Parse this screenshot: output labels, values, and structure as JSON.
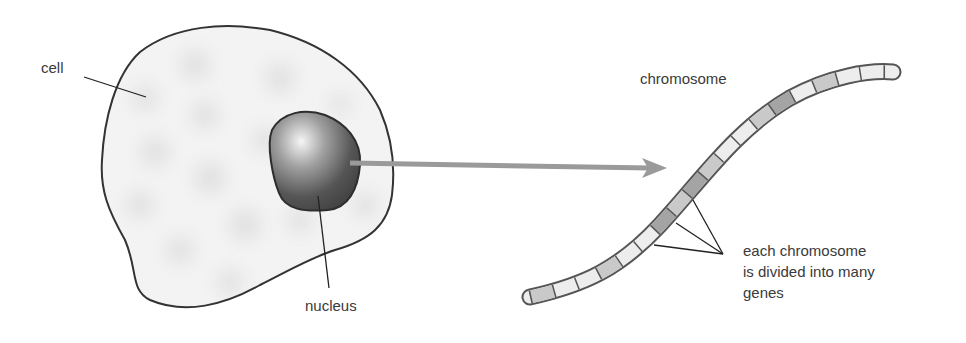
{
  "labels": {
    "cell": "cell",
    "nucleus": "nucleus",
    "chromosome": "chromosome",
    "genes_line1": "each chromosome",
    "genes_line2": "is divided into many",
    "genes_line3": "genes"
  },
  "colors": {
    "cell_fill": "#f2f2f2",
    "cell_outline": "#333333",
    "nucleus_dark": "#3e3e3e",
    "nucleus_highlight": "#f4f4f4",
    "arrow": "#9a9a9a",
    "gene_light": "#eeeeee",
    "gene_mid": "#c8c8c8",
    "gene_dark": "#9e9e9e"
  }
}
